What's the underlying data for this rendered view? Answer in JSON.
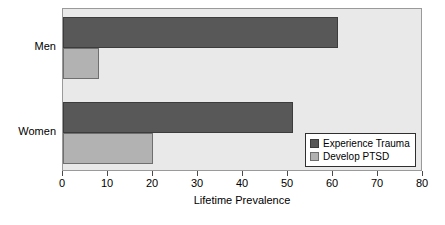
{
  "chart_data": {
    "type": "bar",
    "orientation": "horizontal",
    "title": "",
    "xlabel": "Lifetime Prevalence",
    "ylabel": "",
    "categories": [
      "Men",
      "Women"
    ],
    "series": [
      {
        "name": "Experience Trauma",
        "color": "#585859",
        "values": [
          61,
          51
        ]
      },
      {
        "name": "Develop PTSD",
        "color": "#b2b2b2",
        "values": [
          8,
          20
        ]
      }
    ],
    "xlim": [
      0,
      80
    ],
    "xticks": [
      0,
      10,
      20,
      30,
      40,
      50,
      60,
      70,
      80
    ],
    "xtick_labels": [
      "0",
      "10",
      "20",
      "30",
      "40",
      "50",
      "60",
      "70",
      "80"
    ],
    "grid": false,
    "legend_position": "lower-right",
    "plot_background": "#e9e9e9",
    "frame_color": "#9a9a9a"
  }
}
